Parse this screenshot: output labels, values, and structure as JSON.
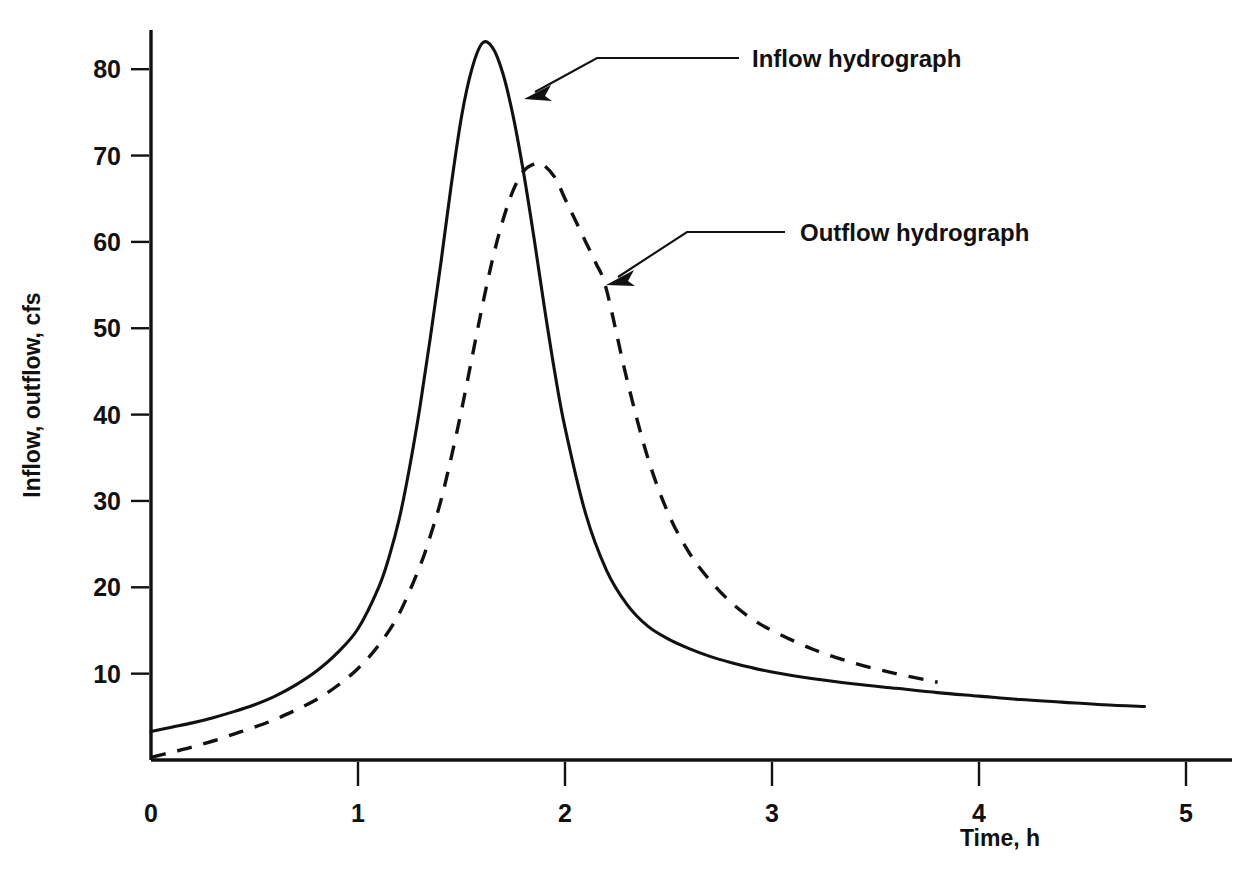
{
  "figure": {
    "background_color": "#ffffff",
    "ink_color": "#111111"
  },
  "axes": {
    "y_title": "Inflow, outflow, cfs",
    "x_title": "Time, h",
    "y_ticks": [
      "10",
      "20",
      "30",
      "40",
      "50",
      "60",
      "70",
      "80"
    ],
    "x_ticks": [
      "0",
      "1",
      "2",
      "3",
      "4",
      "5"
    ]
  },
  "annotations": {
    "inflow_label": "Inflow hydrograph",
    "outflow_label": "Outflow hydrograph"
  },
  "chart_data": {
    "type": "line",
    "title": "",
    "xlabel": "Time, h",
    "ylabel": "Inflow, outflow, cfs",
    "xlim": [
      0,
      5.2
    ],
    "ylim": [
      0,
      88
    ],
    "xticks": [
      0,
      1,
      2,
      3,
      4,
      5
    ],
    "yticks": [
      10,
      20,
      30,
      40,
      50,
      60,
      70,
      80
    ],
    "grid": false,
    "legend": "annotated-leaders",
    "annotations": [
      {
        "text": "Inflow hydrograph",
        "points_to_series": "Inflow hydrograph",
        "at_x": 1.82,
        "at_y": 77.0
      },
      {
        "text": "Outflow hydrograph",
        "points_to_series": "Outflow hydrograph",
        "at_x": 2.21,
        "at_y": 55.2
      }
    ],
    "series": [
      {
        "name": "Inflow hydrograph",
        "style": "solid",
        "color": "#111111",
        "peak": {
          "x": 1.6,
          "y": 83
        },
        "x": [
          0.0,
          0.1,
          0.2,
          0.3,
          0.4,
          0.5,
          0.6,
          0.7,
          0.8,
          0.9,
          1.0,
          1.1,
          1.15,
          1.2,
          1.25,
          1.3,
          1.35,
          1.4,
          1.45,
          1.5,
          1.55,
          1.6,
          1.65,
          1.7,
          1.75,
          1.8,
          1.85,
          1.9,
          1.95,
          2.0,
          2.1,
          2.2,
          2.3,
          2.4,
          2.5,
          2.6,
          2.7,
          2.8,
          2.9,
          3.0,
          3.2,
          3.4,
          3.6,
          3.8,
          4.0,
          4.2,
          4.4,
          4.6,
          4.8
        ],
        "y": [
          3.3,
          3.8,
          4.3,
          4.9,
          5.6,
          6.4,
          7.4,
          8.7,
          10.3,
          12.4,
          15.2,
          20.0,
          23.5,
          28.0,
          34.0,
          41.0,
          49.0,
          57.5,
          66.5,
          74.5,
          80.0,
          83.0,
          82.5,
          79.5,
          74.5,
          68.0,
          60.5,
          52.5,
          45.0,
          38.5,
          28.5,
          22.0,
          18.0,
          15.5,
          14.0,
          12.9,
          12.0,
          11.3,
          10.7,
          10.2,
          9.4,
          8.8,
          8.3,
          7.8,
          7.4,
          7.0,
          6.7,
          6.4,
          6.2
        ]
      },
      {
        "name": "Outflow hydrograph",
        "style": "dashed",
        "color": "#111111",
        "peak": {
          "x": 1.89,
          "y": 69
        },
        "x": [
          0.0,
          0.1,
          0.2,
          0.3,
          0.4,
          0.5,
          0.6,
          0.7,
          0.8,
          0.9,
          1.0,
          1.1,
          1.2,
          1.3,
          1.35,
          1.4,
          1.45,
          1.5,
          1.55,
          1.6,
          1.65,
          1.7,
          1.75,
          1.8,
          1.85,
          1.89,
          1.95,
          2.0,
          2.05,
          2.1,
          2.15,
          2.2,
          2.3,
          2.4,
          2.5,
          2.6,
          2.7,
          2.8,
          2.9,
          3.0,
          3.2,
          3.4,
          3.6,
          3.8
        ],
        "y": [
          0.3,
          0.9,
          1.5,
          2.2,
          3.0,
          3.8,
          4.7,
          5.8,
          7.0,
          8.6,
          10.6,
          13.3,
          17.0,
          22.5,
          26.0,
          30.0,
          35.0,
          40.5,
          46.5,
          52.5,
          58.0,
          62.5,
          66.0,
          68.2,
          69.0,
          69.0,
          67.5,
          65.0,
          62.5,
          60.0,
          57.5,
          54.5,
          44.0,
          35.0,
          28.5,
          24.0,
          20.8,
          18.3,
          16.4,
          15.0,
          12.8,
          11.2,
          10.0,
          9.0
        ]
      }
    ]
  }
}
